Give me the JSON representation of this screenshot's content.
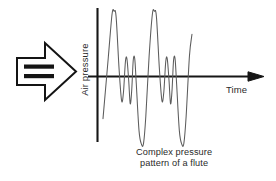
{
  "figure": {
    "name": "complex-pressure-pattern-of-a-flute",
    "caption_line_1": "Complex pressure",
    "caption_line_2": "pattern of a flute",
    "y_axis_label": "Air pressure",
    "x_axis_label": "Time",
    "sound_input_arrow": {
      "semantic": "block-arrow-pointing-right",
      "bars": 2,
      "direction": "right"
    },
    "colors": {
      "background": "#ffffff",
      "axis": "#161616",
      "waveform": "#5c5c5c",
      "text": "#2a2a2a",
      "arrow_outline": "#141414",
      "arrow_bar_fill": "#141414"
    }
  },
  "chart_data": {
    "type": "line",
    "title": "Complex pressure pattern of a flute",
    "xlabel": "Time",
    "ylabel": "Air pressure",
    "grid": false,
    "legend": null,
    "axis_arrows": {
      "x": "right-arrowhead",
      "y": "none"
    },
    "xlim": [
      0,
      1
    ],
    "ylim": [
      -1,
      1
    ],
    "series": [
      {
        "name": "flute pressure waveform",
        "points": [
          [
            0.0,
            -0.62
          ],
          [
            0.042,
            0.28
          ],
          [
            0.072,
            0.92
          ],
          [
            0.088,
            0.96
          ],
          [
            0.104,
            0.88
          ],
          [
            0.128,
            0.1
          ],
          [
            0.148,
            -0.36
          ],
          [
            0.163,
            -0.22
          ],
          [
            0.178,
            0.22
          ],
          [
            0.19,
            0.26
          ],
          [
            0.204,
            -0.06
          ],
          [
            0.216,
            -0.4
          ],
          [
            0.228,
            -0.2
          ],
          [
            0.24,
            0.24
          ],
          [
            0.252,
            0.26
          ],
          [
            0.264,
            -0.1
          ],
          [
            0.286,
            -0.8
          ],
          [
            0.306,
            -1.0
          ],
          [
            0.322,
            -0.98
          ],
          [
            0.34,
            -0.58
          ],
          [
            0.366,
            0.3
          ],
          [
            0.392,
            0.92
          ],
          [
            0.408,
            0.96
          ],
          [
            0.424,
            0.88
          ],
          [
            0.448,
            0.1
          ],
          [
            0.468,
            -0.36
          ],
          [
            0.483,
            -0.22
          ],
          [
            0.498,
            0.22
          ],
          [
            0.51,
            0.26
          ],
          [
            0.524,
            -0.06
          ],
          [
            0.536,
            -0.4
          ],
          [
            0.548,
            -0.2
          ],
          [
            0.56,
            0.24
          ],
          [
            0.572,
            0.26
          ],
          [
            0.584,
            -0.1
          ],
          [
            0.606,
            -0.8
          ],
          [
            0.626,
            -1.0
          ],
          [
            0.642,
            -0.98
          ],
          [
            0.66,
            -0.58
          ],
          [
            0.686,
            0.3
          ],
          [
            0.706,
            0.62
          ]
        ]
      }
    ]
  }
}
